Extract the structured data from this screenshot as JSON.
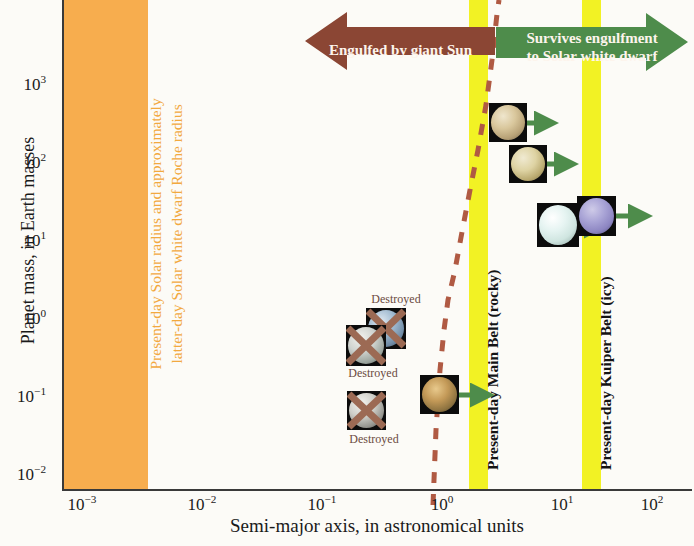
{
  "chart_data": {
    "type": "scatter",
    "title": "",
    "xlabel": "Semi-major axis, in astronomical units",
    "ylabel": "Planet mass, in Earth masses",
    "xscale": "log",
    "yscale": "log",
    "xlim": [
      0.001,
      200
    ],
    "ylim": [
      0.01,
      3000
    ],
    "xticks": [
      "10−3",
      "10−2",
      "10−1",
      "10⁰",
      "10¹",
      "10²"
    ],
    "xtick_values": [
      0.001,
      0.01,
      0.1,
      1,
      10,
      100
    ],
    "yticks": [
      "10−2",
      "10−1",
      "10⁰",
      "10¹",
      "10²",
      "10³"
    ],
    "ytick_values": [
      0.01,
      0.1,
      1,
      10,
      100,
      1000
    ],
    "grid": false,
    "legend": "none",
    "points": [
      {
        "name": "Jupiter",
        "x": 5.2,
        "y": 318,
        "status": "survives",
        "arrow": "right"
      },
      {
        "name": "Saturn",
        "x": 9.6,
        "y": 95,
        "status": "survives",
        "arrow": "right"
      },
      {
        "name": "Uranus",
        "x": 19.2,
        "y": 14.5,
        "status": "survives",
        "arrow": "right"
      },
      {
        "name": "Neptune",
        "x": 30.1,
        "y": 17.1,
        "status": "survives",
        "arrow": "right"
      },
      {
        "name": "Mars",
        "x": 1.52,
        "y": 0.107,
        "status": "survives",
        "arrow": "right"
      },
      {
        "name": "Venus",
        "x": 0.72,
        "y": 0.815,
        "status": "destroyed",
        "arrow": "none"
      },
      {
        "name": "Earth",
        "x": 1.0,
        "y": 1.0,
        "status": "destroyed",
        "arrow": "none"
      },
      {
        "name": "Mercury",
        "x": 0.39,
        "y": 0.055,
        "status": "destroyed",
        "arrow": "none"
      }
    ],
    "bands": [
      {
        "name": "Present-day Solar radius and approximately latter-day Solar white dwarf Roche radius",
        "x_from": 0.001,
        "x_to": 0.005,
        "color": "#F7AD4E"
      },
      {
        "name": "Present-day Main Belt (rocky)",
        "x_from": 2.2,
        "x_to": 3.2,
        "color": "#F2F224"
      },
      {
        "name": "Present-day Kuiper Belt (icy)",
        "x_from": 30,
        "x_to": 48,
        "color": "#F2F224"
      }
    ],
    "boundary_curve": {
      "label": "engulfment boundary",
      "style": "dashed",
      "color": "#B05A43"
    },
    "annotations": [
      {
        "text": "Engulfed by giant Sun",
        "direction": "left",
        "color": "#8B4634"
      },
      {
        "text": "Survives engulfment to Solar white dwarf",
        "direction": "right",
        "color": "#4E8C4B"
      }
    ]
  },
  "axes": {
    "ylabel": "Planet mass, in Earth masses",
    "xlabel": "Semi-major axis, in astronomical units",
    "yticks": [
      {
        "mant": "10",
        "exp": "−2"
      },
      {
        "mant": "10",
        "exp": "−1"
      },
      {
        "mant": "10",
        "exp": "0"
      },
      {
        "mant": "10",
        "exp": "1"
      },
      {
        "mant": "10",
        "exp": "2"
      },
      {
        "mant": "10",
        "exp": "3"
      }
    ],
    "xticks": [
      {
        "mant": "10",
        "exp": "−3"
      },
      {
        "mant": "10",
        "exp": "−2"
      },
      {
        "mant": "10",
        "exp": "−1"
      },
      {
        "mant": "10",
        "exp": "0"
      },
      {
        "mant": "10",
        "exp": "1"
      },
      {
        "mant": "10",
        "exp": "2"
      }
    ]
  },
  "bands": {
    "orange_line1": "Present-day Solar radius and approximately",
    "orange_line2": "latter-day Solar white dwarf Roche radius",
    "main_belt": "Present-day Main Belt (rocky)",
    "kuiper_belt": "Present-day Kuiper Belt (icy)"
  },
  "banners": {
    "left": "Engulfed by giant Sun",
    "right_line1": "Survives engulfment",
    "right_line2": "to Solar white dwarf"
  },
  "labels": {
    "destroyed": "Destroyed"
  },
  "colors": {
    "orange": "#F7AD4E",
    "yellow": "#F2F224",
    "brown": "#8B4634",
    "green": "#4E8C4B",
    "dashed": "#B05A43"
  }
}
